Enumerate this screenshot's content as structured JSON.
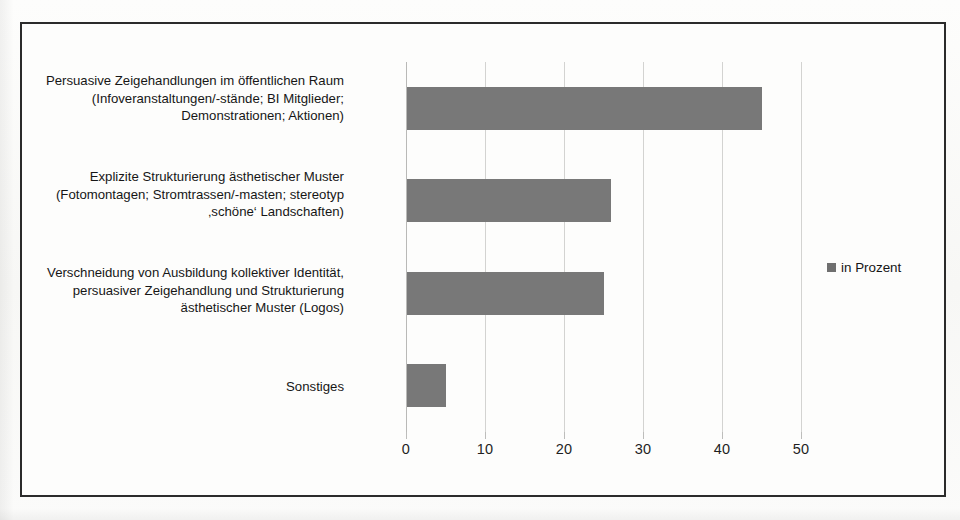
{
  "chart_data": {
    "type": "bar",
    "orientation": "horizontal",
    "title": "",
    "xlabel": "",
    "ylabel": "",
    "xlim": [
      0,
      50
    ],
    "xticks": [
      0,
      10,
      20,
      30,
      40,
      50
    ],
    "xtick_labels": [
      "0",
      "10",
      "20",
      "30",
      "40",
      "50"
    ],
    "grid": true,
    "grid_axis": "x",
    "legend_position": "right",
    "legend": [
      "in Prozent"
    ],
    "series_name": "in Prozent",
    "bar_color": "#787878",
    "frame_color": "#2b2b2b",
    "gridline_color": "#d3d3d1",
    "categories": [
      "Persuasive Zeigehandlungen im öffentlichen Raum\n(Infoveranstaltungen/-stände; BI Mitglieder;\nDemonstrationen; Aktionen)",
      "Explizite Strukturierung ästhetischer Muster\n(Fotomontagen; Stromtrassen/-masten; stereotyp\n‚schöne‘ Landschaften)",
      "Verschneidung von Ausbildung kollektiver Identität,\npersuasiver Zeigehandlung und Strukturierung\nästhetischer Muster (Logos)",
      "Sonstiges"
    ],
    "values": [
      45,
      26,
      25,
      5
    ]
  },
  "legend": {
    "label": "in Prozent",
    "swatch_color": "#6f6f6f"
  },
  "axis": {
    "ticks": [
      "0",
      "10",
      "20",
      "30",
      "40",
      "50"
    ]
  },
  "categories": {
    "c0": "Persuasive Zeigehandlungen im öffentlichen Raum\n(Infoveranstaltungen/-stände; BI Mitglieder;\nDemonstrationen; Aktionen)",
    "c1": "Explizite Strukturierung ästhetischer Muster\n(Fotomontagen; Stromtrassen/-masten; stereotyp\n‚schöne‘ Landschaften)",
    "c2": "Verschneidung von Ausbildung kollektiver Identität,\npersuasiver Zeigehandlung und Strukturierung\nästhetischer Muster (Logos)",
    "c3": "Sonstiges"
  }
}
